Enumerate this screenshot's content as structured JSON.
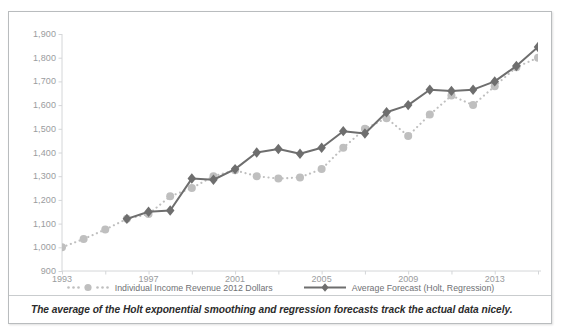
{
  "figure": {
    "caption": "The average of the Holt exponential smoothing and regression forecasts track the actual data nicely."
  },
  "legend": [
    {
      "label": "Individual Income Revenue 2012 Dollars",
      "marker": "circle-dotted-marker",
      "color": "#bfbfbf"
    },
    {
      "label": "Average Forecast (Holt, Regression)",
      "marker": "diamond-solid-marker",
      "color": "#6e6e6e"
    }
  ],
  "colors": {
    "actual_series": "#bfbfbf",
    "forecast_series": "#6e6e6e",
    "axis": "#d4d6d8",
    "tick_text": "#9a9c9e",
    "frame": "#b9bcbe"
  },
  "chart_data": {
    "type": "line",
    "title": "",
    "xlabel": "",
    "ylabel": "",
    "xlim": [
      1993,
      2015
    ],
    "ylim": [
      900,
      1900
    ],
    "yticks": [
      900,
      1000,
      1100,
      1200,
      1300,
      1400,
      1500,
      1600,
      1700,
      1800,
      1900
    ],
    "ytick_labels": [
      "900",
      "1,000",
      "1,100",
      "1,200",
      "1,300",
      "1,400",
      "1,500",
      "1,600",
      "1,700",
      "1,800",
      "1,900"
    ],
    "xticks": [
      1993,
      1995,
      1997,
      1999,
      2001,
      2003,
      2005,
      2007,
      2009,
      2011,
      2013,
      2015
    ],
    "xtick_labels": [
      "1993",
      "1997",
      "2001",
      "2005",
      "2009",
      "2013"
    ],
    "xtick_labels_values": [
      1993,
      1997,
      2001,
      2005,
      2009,
      2013
    ],
    "grid": false,
    "legend_position": "bottom",
    "series": [
      {
        "name": "Individual Income Revenue 2012 Dollars",
        "style": "dotted",
        "marker": "circle",
        "color": "#bfbfbf",
        "x": [
          1993,
          1994,
          1995,
          1996,
          1997,
          1998,
          1999,
          2000,
          2001,
          2002,
          2003,
          2004,
          2005,
          2006,
          2007,
          2008,
          2009,
          2010,
          2011,
          2012,
          2013,
          2014,
          2015
        ],
        "values": [
          1000,
          1035,
          1075,
          1120,
          1140,
          1215,
          1250,
          1300,
          1325,
          1300,
          1290,
          1295,
          1330,
          1420,
          1500,
          1545,
          1470,
          1560,
          1640,
          1600,
          1680,
          1760,
          1800
        ]
      },
      {
        "name": "Average Forecast (Holt, Regression)",
        "style": "solid",
        "marker": "diamond",
        "color": "#6e6e6e",
        "x": [
          1996,
          1997,
          1998,
          1999,
          2000,
          2001,
          2002,
          2003,
          2004,
          2005,
          2006,
          2007,
          2008,
          2009,
          2010,
          2011,
          2012,
          2013,
          2014,
          2015
        ],
        "values": [
          1120,
          1150,
          1155,
          1290,
          1285,
          1330,
          1400,
          1415,
          1395,
          1420,
          1490,
          1480,
          1570,
          1600,
          1665,
          1660,
          1665,
          1700,
          1765,
          1845
        ]
      }
    ]
  }
}
